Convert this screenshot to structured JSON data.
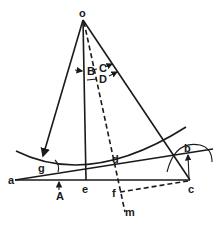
{
  "diagram": {
    "type": "geometric construction",
    "points": {
      "o": "o",
      "a": "a",
      "b": "b",
      "c": "c",
      "d": "d",
      "e": "e",
      "f": "f",
      "g": "g",
      "m": "m"
    },
    "angles": {
      "A": "A",
      "B": "B",
      "C": "C",
      "D": "D"
    },
    "colors": {
      "ink": "#1a1a1a",
      "background": "#ffffff"
    }
  }
}
